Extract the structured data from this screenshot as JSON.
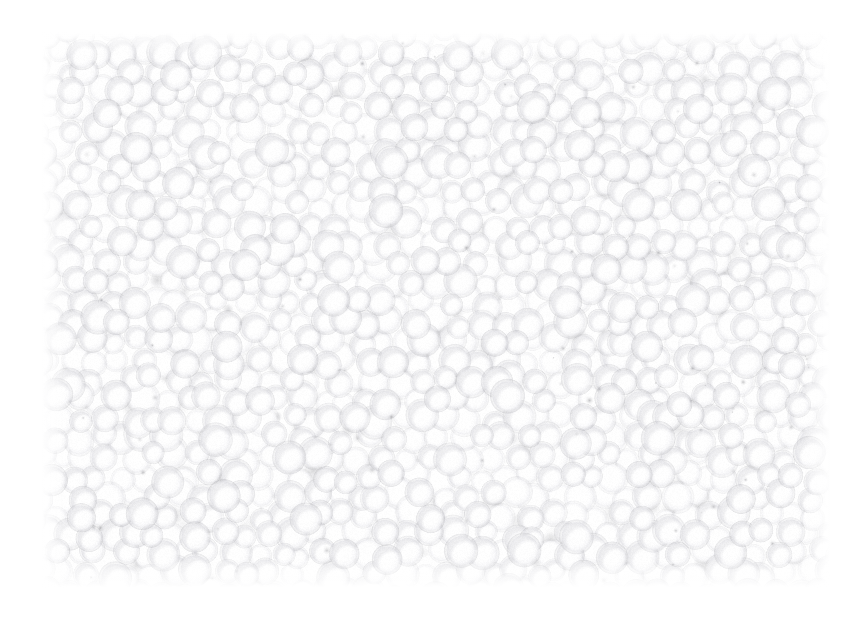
{
  "page": {
    "background_color": "#ffffff",
    "width": 866,
    "height": 624
  },
  "figure": {
    "kind": "micrograph",
    "content_region": {
      "x": 42,
      "y": 32,
      "width": 788,
      "height": 556
    },
    "appearance": {
      "particle_fill_color": "#ffffff",
      "particle_shadow_color": "#b9b9bd",
      "interstice_dark_color": "#6f6f76",
      "background_color": "#ffffff",
      "mean_particle_diameter_px": 25,
      "particle_diameter_min_px": 15,
      "particle_diameter_max_px": 34,
      "packing": "random close packed",
      "approx_particle_count": 2300,
      "contrast": "very low",
      "exposure": "overexposed / blown highlights"
    },
    "overlays": {
      "scale_bar": null,
      "caption": null,
      "annotations": []
    }
  }
}
